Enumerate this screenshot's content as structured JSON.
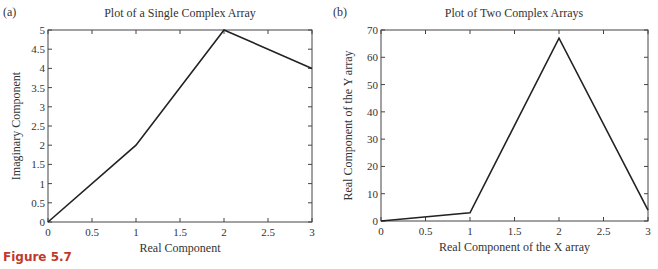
{
  "figure_caption": "Figure 5.7",
  "chart_data": [
    {
      "type": "line",
      "panel_label": "(a)",
      "title": "Plot of a Single Complex Array",
      "xlabel": "Real Component",
      "ylabel": "Imaginary Component",
      "xlim": [
        0,
        3
      ],
      "ylim": [
        0,
        5
      ],
      "xticks": [
        0,
        0.5,
        1,
        1.5,
        2,
        2.5,
        3
      ],
      "xtick_labels": [
        "0",
        "0.5",
        "1",
        "1.5",
        "2",
        "2.5",
        "3"
      ],
      "yticks": [
        0,
        0.5,
        1,
        1.5,
        2,
        2.5,
        3,
        3.5,
        4,
        4.5,
        5
      ],
      "ytick_labels": [
        "0",
        "0.5",
        "1",
        "1.5",
        "2",
        "2.5",
        "3",
        "3.5",
        "4",
        "4.5",
        "5"
      ],
      "grid": false,
      "series": [
        {
          "name": "complex array",
          "x": [
            0,
            1,
            2,
            3
          ],
          "y": [
            0,
            2,
            5,
            4
          ],
          "color": "#222222"
        }
      ]
    },
    {
      "type": "line",
      "panel_label": "(b)",
      "title": "Plot of Two Complex Arrays",
      "xlabel": "Real Component of the X array",
      "ylabel": "Real Component of the Y array",
      "xlim": [
        0,
        3
      ],
      "ylim": [
        0,
        70
      ],
      "xticks": [
        0,
        0.5,
        1,
        1.5,
        2,
        2.5,
        3
      ],
      "xtick_labels": [
        "0",
        "0.5",
        "1",
        "1.5",
        "2",
        "2.5",
        "3"
      ],
      "yticks": [
        0,
        10,
        20,
        30,
        40,
        50,
        60,
        70
      ],
      "ytick_labels": [
        "0",
        "10",
        "20",
        "30",
        "40",
        "50",
        "60",
        "70"
      ],
      "grid": false,
      "series": [
        {
          "name": "real parts",
          "x": [
            0,
            1,
            2,
            3
          ],
          "y": [
            0,
            3,
            67,
            4
          ],
          "color": "#222222"
        }
      ]
    }
  ]
}
